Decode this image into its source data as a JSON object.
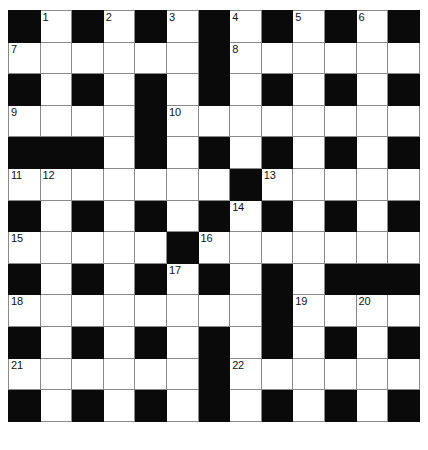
{
  "puzzle": {
    "title": "Crossword Grid",
    "rows": 13,
    "cols": 13,
    "colors": {
      "block": "#0a0a0a",
      "cell": "#ffffff",
      "grid_line": "#8a8a8a",
      "number": "#111111"
    },
    "grid": [
      [
        {
          "block": true,
          "num": ""
        },
        {
          "block": false,
          "num": "1"
        },
        {
          "block": true,
          "num": ""
        },
        {
          "block": false,
          "num": "2"
        },
        {
          "block": true,
          "num": ""
        },
        {
          "block": false,
          "num": "3"
        },
        {
          "block": true,
          "num": ""
        },
        {
          "block": false,
          "num": "4"
        },
        {
          "block": true,
          "num": ""
        },
        {
          "block": false,
          "num": "5"
        },
        {
          "block": true,
          "num": ""
        },
        {
          "block": false,
          "num": "6"
        },
        {
          "block": true,
          "num": ""
        }
      ],
      [
        {
          "block": false,
          "num": "7"
        },
        {
          "block": false,
          "num": ""
        },
        {
          "block": false,
          "num": ""
        },
        {
          "block": false,
          "num": ""
        },
        {
          "block": false,
          "num": ""
        },
        {
          "block": false,
          "num": ""
        },
        {
          "block": true,
          "num": ""
        },
        {
          "block": false,
          "num": "8"
        },
        {
          "block": false,
          "num": ""
        },
        {
          "block": false,
          "num": ""
        },
        {
          "block": false,
          "num": ""
        },
        {
          "block": false,
          "num": ""
        },
        {
          "block": false,
          "num": ""
        }
      ],
      [
        {
          "block": true,
          "num": ""
        },
        {
          "block": false,
          "num": ""
        },
        {
          "block": true,
          "num": ""
        },
        {
          "block": false,
          "num": ""
        },
        {
          "block": true,
          "num": ""
        },
        {
          "block": false,
          "num": ""
        },
        {
          "block": true,
          "num": ""
        },
        {
          "block": false,
          "num": ""
        },
        {
          "block": true,
          "num": ""
        },
        {
          "block": false,
          "num": ""
        },
        {
          "block": true,
          "num": ""
        },
        {
          "block": false,
          "num": ""
        },
        {
          "block": true,
          "num": ""
        }
      ],
      [
        {
          "block": false,
          "num": "9"
        },
        {
          "block": false,
          "num": ""
        },
        {
          "block": false,
          "num": ""
        },
        {
          "block": false,
          "num": ""
        },
        {
          "block": true,
          "num": ""
        },
        {
          "block": false,
          "num": "10"
        },
        {
          "block": false,
          "num": ""
        },
        {
          "block": false,
          "num": ""
        },
        {
          "block": false,
          "num": ""
        },
        {
          "block": false,
          "num": ""
        },
        {
          "block": false,
          "num": ""
        },
        {
          "block": false,
          "num": ""
        },
        {
          "block": false,
          "num": ""
        }
      ],
      [
        {
          "block": true,
          "num": ""
        },
        {
          "block": true,
          "num": ""
        },
        {
          "block": true,
          "num": ""
        },
        {
          "block": false,
          "num": ""
        },
        {
          "block": true,
          "num": ""
        },
        {
          "block": false,
          "num": ""
        },
        {
          "block": true,
          "num": ""
        },
        {
          "block": false,
          "num": ""
        },
        {
          "block": true,
          "num": ""
        },
        {
          "block": false,
          "num": ""
        },
        {
          "block": true,
          "num": ""
        },
        {
          "block": false,
          "num": ""
        },
        {
          "block": true,
          "num": ""
        }
      ],
      [
        {
          "block": false,
          "num": "11"
        },
        {
          "block": false,
          "num": "12"
        },
        {
          "block": false,
          "num": ""
        },
        {
          "block": false,
          "num": ""
        },
        {
          "block": false,
          "num": ""
        },
        {
          "block": false,
          "num": ""
        },
        {
          "block": false,
          "num": ""
        },
        {
          "block": true,
          "num": ""
        },
        {
          "block": false,
          "num": "13"
        },
        {
          "block": false,
          "num": ""
        },
        {
          "block": false,
          "num": ""
        },
        {
          "block": false,
          "num": ""
        },
        {
          "block": false,
          "num": ""
        }
      ],
      [
        {
          "block": true,
          "num": ""
        },
        {
          "block": false,
          "num": ""
        },
        {
          "block": true,
          "num": ""
        },
        {
          "block": false,
          "num": ""
        },
        {
          "block": true,
          "num": ""
        },
        {
          "block": false,
          "num": ""
        },
        {
          "block": true,
          "num": ""
        },
        {
          "block": false,
          "num": "14"
        },
        {
          "block": true,
          "num": ""
        },
        {
          "block": false,
          "num": ""
        },
        {
          "block": true,
          "num": ""
        },
        {
          "block": false,
          "num": ""
        },
        {
          "block": true,
          "num": ""
        }
      ],
      [
        {
          "block": false,
          "num": "15"
        },
        {
          "block": false,
          "num": ""
        },
        {
          "block": false,
          "num": ""
        },
        {
          "block": false,
          "num": ""
        },
        {
          "block": false,
          "num": ""
        },
        {
          "block": true,
          "num": ""
        },
        {
          "block": false,
          "num": "16"
        },
        {
          "block": false,
          "num": ""
        },
        {
          "block": false,
          "num": ""
        },
        {
          "block": false,
          "num": ""
        },
        {
          "block": false,
          "num": ""
        },
        {
          "block": false,
          "num": ""
        },
        {
          "block": false,
          "num": ""
        }
      ],
      [
        {
          "block": true,
          "num": ""
        },
        {
          "block": false,
          "num": ""
        },
        {
          "block": true,
          "num": ""
        },
        {
          "block": false,
          "num": ""
        },
        {
          "block": true,
          "num": ""
        },
        {
          "block": false,
          "num": "17"
        },
        {
          "block": true,
          "num": ""
        },
        {
          "block": false,
          "num": ""
        },
        {
          "block": true,
          "num": ""
        },
        {
          "block": false,
          "num": ""
        },
        {
          "block": true,
          "num": ""
        },
        {
          "block": true,
          "num": ""
        },
        {
          "block": true,
          "num": ""
        }
      ],
      [
        {
          "block": false,
          "num": "18"
        },
        {
          "block": false,
          "num": ""
        },
        {
          "block": false,
          "num": ""
        },
        {
          "block": false,
          "num": ""
        },
        {
          "block": false,
          "num": ""
        },
        {
          "block": false,
          "num": ""
        },
        {
          "block": false,
          "num": ""
        },
        {
          "block": false,
          "num": ""
        },
        {
          "block": true,
          "num": ""
        },
        {
          "block": false,
          "num": "19"
        },
        {
          "block": false,
          "num": ""
        },
        {
          "block": false,
          "num": "20"
        },
        {
          "block": false,
          "num": ""
        }
      ],
      [
        {
          "block": true,
          "num": ""
        },
        {
          "block": false,
          "num": ""
        },
        {
          "block": true,
          "num": ""
        },
        {
          "block": false,
          "num": ""
        },
        {
          "block": true,
          "num": ""
        },
        {
          "block": false,
          "num": ""
        },
        {
          "block": true,
          "num": ""
        },
        {
          "block": false,
          "num": ""
        },
        {
          "block": true,
          "num": ""
        },
        {
          "block": false,
          "num": ""
        },
        {
          "block": true,
          "num": ""
        },
        {
          "block": false,
          "num": ""
        },
        {
          "block": true,
          "num": ""
        }
      ],
      [
        {
          "block": false,
          "num": "21"
        },
        {
          "block": false,
          "num": ""
        },
        {
          "block": false,
          "num": ""
        },
        {
          "block": false,
          "num": ""
        },
        {
          "block": false,
          "num": ""
        },
        {
          "block": false,
          "num": ""
        },
        {
          "block": true,
          "num": ""
        },
        {
          "block": false,
          "num": "22"
        },
        {
          "block": false,
          "num": ""
        },
        {
          "block": false,
          "num": ""
        },
        {
          "block": false,
          "num": ""
        },
        {
          "block": false,
          "num": ""
        },
        {
          "block": false,
          "num": ""
        }
      ],
      [
        {
          "block": true,
          "num": ""
        },
        {
          "block": false,
          "num": ""
        },
        {
          "block": true,
          "num": ""
        },
        {
          "block": false,
          "num": ""
        },
        {
          "block": true,
          "num": ""
        },
        {
          "block": false,
          "num": ""
        },
        {
          "block": true,
          "num": ""
        },
        {
          "block": false,
          "num": ""
        },
        {
          "block": true,
          "num": ""
        },
        {
          "block": false,
          "num": ""
        },
        {
          "block": true,
          "num": ""
        },
        {
          "block": false,
          "num": ""
        },
        {
          "block": true,
          "num": ""
        }
      ]
    ]
  }
}
